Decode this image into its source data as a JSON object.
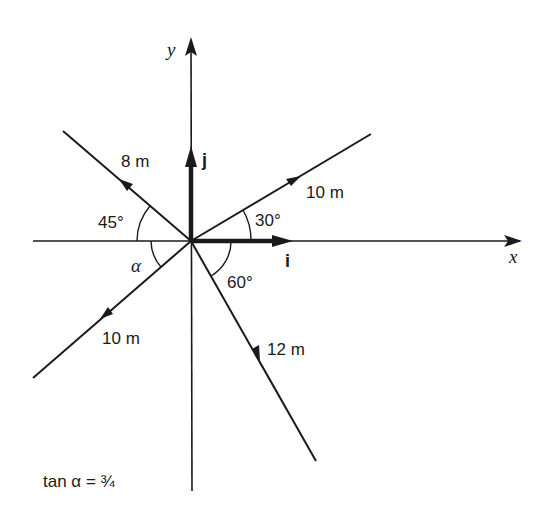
{
  "diagram": {
    "origin": {
      "x": 191,
      "y": 241
    },
    "axes": {
      "x_label": "x",
      "y_label": "y"
    },
    "unit_vectors": {
      "i_label": "i",
      "j_label": "j"
    },
    "vectors": [
      {
        "id": "v8",
        "label": "8 m",
        "magnitude": "8m",
        "angle_label": "45°",
        "direction": "135° from +x (toward origin reversed: arrow points up-left)"
      },
      {
        "id": "v10a",
        "label": "10 m",
        "angle_label": "30°",
        "direction": "30° above +x"
      },
      {
        "id": "v10b",
        "label": "10 m",
        "angle_label": "α",
        "direction": "below -x by α"
      },
      {
        "id": "v12",
        "label": "12 m",
        "angle_label": "60°",
        "direction": "60° below +x"
      }
    ],
    "labels": {
      "v8": "8 m",
      "v10a": "10 m",
      "v10b": "10 m",
      "v12": "12 m",
      "angle45": "45°",
      "angle30": "30°",
      "angle60": "60°",
      "alpha": "α"
    },
    "note": "tan α = ¾",
    "colors": {
      "ink": "#1a1a1a",
      "background": "#ffffff"
    }
  }
}
